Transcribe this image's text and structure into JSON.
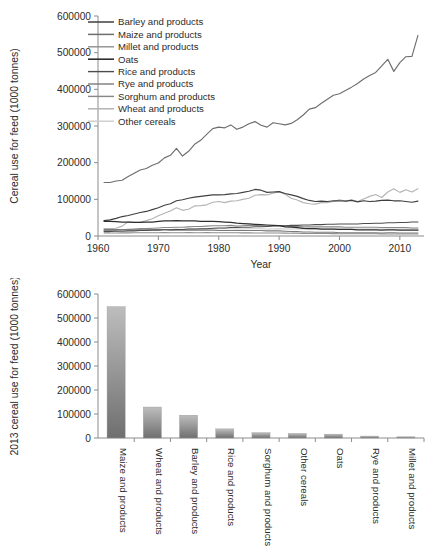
{
  "figure": {
    "background": "#ffffff",
    "text_color": "#231f20",
    "axis_color": "#8c8c8c"
  },
  "chart_data": [
    {
      "id": "cereal-feed-timeseries",
      "type": "line",
      "title": "",
      "xlabel": "Year",
      "ylabel": "Cereal use for feed (1000 tonnes)",
      "xlim": [
        1960,
        2014
      ],
      "ylim": [
        0,
        600000
      ],
      "xticks": [
        1960,
        1970,
        1980,
        1990,
        2000,
        2010
      ],
      "xtick_labels": [
        "1960",
        "1970",
        "1980",
        "1990",
        "2000",
        "2010"
      ],
      "yticks": [
        0,
        100000,
        200000,
        300000,
        400000,
        500000,
        600000
      ],
      "ytick_labels": [
        "0",
        "100000",
        "200000",
        "300000",
        "400000",
        "500000",
        "600000"
      ],
      "grid": false,
      "legend_position": "top-left",
      "x": [
        1961,
        1962,
        1963,
        1964,
        1965,
        1966,
        1967,
        1968,
        1969,
        1970,
        1971,
        1972,
        1973,
        1974,
        1975,
        1976,
        1977,
        1978,
        1979,
        1980,
        1981,
        1982,
        1983,
        1984,
        1985,
        1986,
        1987,
        1988,
        1989,
        1990,
        1991,
        1992,
        1993,
        1994,
        1995,
        1996,
        1997,
        1998,
        1999,
        2000,
        2001,
        2002,
        2003,
        2004,
        2005,
        2006,
        2007,
        2008,
        2009,
        2010,
        2011,
        2012,
        2013
      ],
      "series": [
        {
          "name": "Barley and products",
          "color": "#3f3f3f",
          "width": 1.15,
          "values": [
            42000,
            44000,
            48000,
            53000,
            56000,
            60000,
            64000,
            67000,
            72000,
            77000,
            84000,
            88000,
            96000,
            99000,
            103000,
            106000,
            108000,
            110000,
            112000,
            112000,
            113000,
            115000,
            116000,
            119000,
            122000,
            127000,
            125000,
            119000,
            120000,
            121000,
            116000,
            112000,
            108000,
            102000,
            97000,
            94000,
            95000,
            94000,
            96000,
            96000,
            95000,
            97000,
            93000,
            96000,
            94000,
            95000,
            97000,
            98000,
            96000,
            96000,
            94000,
            92000,
            95000
          ]
        },
        {
          "name": "Maize and products",
          "color": "#6e6e6e",
          "width": 1.15,
          "values": [
            146000,
            146000,
            150000,
            152000,
            162000,
            171000,
            180000,
            184000,
            193000,
            199000,
            213000,
            220000,
            239000,
            218000,
            231000,
            250000,
            261000,
            277000,
            293000,
            297000,
            295000,
            303000,
            291000,
            297000,
            306000,
            312000,
            302000,
            297000,
            309000,
            306000,
            303000,
            307000,
            317000,
            330000,
            346000,
            350000,
            362000,
            373000,
            384000,
            388000,
            397000,
            406000,
            416000,
            428000,
            438000,
            446000,
            464000,
            482000,
            449000,
            473000,
            489000,
            490000,
            547000
          ]
        },
        {
          "name": "Millet and products",
          "color": "#8e8e8e",
          "width": 1.05,
          "values": [
            8000,
            8200,
            8300,
            8500,
            8600,
            8700,
            8800,
            8900,
            9000,
            9100,
            9200,
            9000,
            9100,
            9000,
            9200,
            9100,
            9000,
            9200,
            9100,
            9000,
            8900,
            8800,
            8700,
            8600,
            8500,
            8400,
            8300,
            8200,
            8100,
            8000,
            7800,
            7600,
            7400,
            7200,
            7000,
            6800,
            6700,
            6600,
            6500,
            6400,
            6300,
            6200,
            6100,
            6000,
            6000,
            5900,
            5800,
            5700,
            5600,
            5500,
            5400,
            5300,
            5200
          ]
        },
        {
          "name": "Oats",
          "color": "#2e2e2e",
          "width": 1.25,
          "values": [
            40000,
            40000,
            39000,
            38000,
            38000,
            37000,
            37000,
            38000,
            38000,
            40000,
            41000,
            41000,
            42000,
            41000,
            41000,
            41000,
            40000,
            40000,
            40000,
            39000,
            38000,
            37000,
            35000,
            34000,
            33000,
            32000,
            31000,
            30000,
            29000,
            28000,
            25000,
            24000,
            23000,
            21000,
            20000,
            20000,
            19000,
            19000,
            19000,
            18000,
            18000,
            18000,
            17000,
            17000,
            17000,
            17000,
            16000,
            17000,
            17000,
            16000,
            16000,
            16000,
            16000
          ]
        },
        {
          "name": "Rice and products",
          "color": "#4d4d4d",
          "width": 1.05,
          "values": [
            12000,
            12000,
            13000,
            13000,
            14000,
            14000,
            15000,
            15000,
            16000,
            16000,
            17000,
            17000,
            18000,
            18000,
            19000,
            19000,
            20000,
            20000,
            21000,
            22000,
            22000,
            23000,
            23000,
            24000,
            24000,
            25000,
            25000,
            26000,
            27000,
            28000,
            28000,
            29000,
            29000,
            30000,
            30000,
            31000,
            31000,
            32000,
            32000,
            33000,
            33000,
            33000,
            33000,
            34000,
            34000,
            35000,
            35000,
            36000,
            36000,
            37000,
            37000,
            38000,
            38000
          ]
        },
        {
          "name": "Rye and products",
          "color": "#7a7a7a",
          "width": 1.05,
          "values": [
            18000,
            18000,
            18000,
            18000,
            17000,
            17000,
            17000,
            17000,
            17000,
            17000,
            17000,
            16000,
            16000,
            16000,
            16000,
            16000,
            16000,
            16000,
            16000,
            15000,
            15000,
            15000,
            15000,
            15000,
            15000,
            15000,
            15000,
            14000,
            14000,
            14000,
            13000,
            12000,
            12000,
            11000,
            11000,
            10000,
            10000,
            10000,
            10000,
            9000,
            9000,
            9000,
            9000,
            9000,
            9000,
            9000,
            8000,
            9000,
            9000,
            8000,
            8000,
            8000,
            8000
          ]
        },
        {
          "name": "Sorghum and products",
          "color": "#888888",
          "width": 1.1,
          "values": [
            15000,
            15000,
            16000,
            17000,
            18000,
            19000,
            20000,
            20000,
            21000,
            22000,
            23000,
            23000,
            24000,
            24000,
            25000,
            26000,
            26000,
            27000,
            28000,
            28000,
            28000,
            29000,
            27000,
            28000,
            29000,
            29000,
            28000,
            27000,
            28000,
            28000,
            27000,
            26000,
            26000,
            25000,
            25000,
            25000,
            25000,
            25000,
            25000,
            25000,
            24000,
            24000,
            24000,
            24000,
            24000,
            24000,
            23000,
            23000,
            23000,
            23000,
            23000,
            22000,
            22000
          ]
        },
        {
          "name": "Wheat and products",
          "color": "#b4b4b4",
          "width": 1.15,
          "values": [
            20000,
            20000,
            21000,
            27000,
            39000,
            37000,
            38000,
            42000,
            47000,
            55000,
            62000,
            68000,
            77000,
            70000,
            73000,
            82000,
            83000,
            85000,
            92000,
            94000,
            91000,
            95000,
            96000,
            100000,
            103000,
            111000,
            113000,
            112000,
            117000,
            121000,
            114000,
            103000,
            98000,
            91000,
            88000,
            87000,
            91000,
            91000,
            94000,
            99000,
            95000,
            99000,
            94000,
            101000,
            108000,
            113000,
            105000,
            120000,
            129000,
            119000,
            126000,
            120000,
            129000
          ]
        },
        {
          "name": "Other cereals",
          "color": "#cccccc",
          "width": 1.05,
          "values": [
            14000,
            14000,
            14000,
            15000,
            15000,
            16000,
            16000,
            17000,
            17000,
            18000,
            18000,
            18000,
            19000,
            18000,
            19000,
            19000,
            19000,
            20000,
            20000,
            20000,
            20000,
            20000,
            19000,
            19000,
            20000,
            20000,
            20000,
            19000,
            19000,
            20000,
            19000,
            19000,
            19000,
            19000,
            19000,
            19000,
            19000,
            19000,
            19000,
            19000,
            19000,
            19000,
            19000,
            19000,
            19000,
            19000,
            19000,
            19000,
            19000,
            19000,
            19000,
            19000,
            19000
          ]
        }
      ]
    },
    {
      "id": "cereal-feed-2013-ranked",
      "type": "bar",
      "title": "",
      "xlabel": "",
      "ylabel": "2013 cereal use for feed (1000 tonnes)",
      "ylim": [
        0,
        600000
      ],
      "yticks": [
        0,
        100000,
        200000,
        300000,
        400000,
        500000,
        600000
      ],
      "ytick_labels": [
        "0",
        "100000",
        "200000",
        "300000",
        "400000",
        "500000",
        "600000"
      ],
      "grid": false,
      "bar_color_top": "#bdbdbd",
      "bar_color_bottom": "#6f6f6f",
      "categories": [
        "Maize and products",
        "Wheat and products",
        "Barley and products",
        "Rice and products",
        "Sorghum and products",
        "Other cereals",
        "Oats",
        "Rye and products",
        "Millet and products"
      ],
      "values": [
        547000,
        129000,
        95000,
        38000,
        22000,
        19000,
        16000,
        8000,
        2000
      ]
    }
  ]
}
